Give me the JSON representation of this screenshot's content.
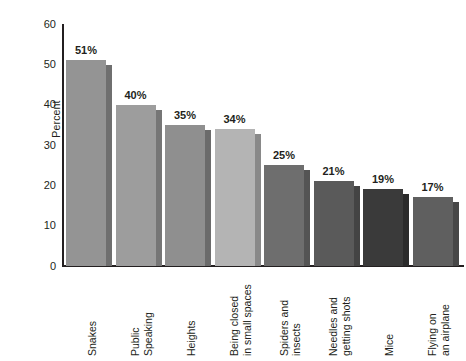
{
  "chart_data": {
    "type": "bar",
    "title": "",
    "subtitle": "",
    "xlabel": "",
    "ylabel": "Percent",
    "ylim": [
      0,
      60
    ],
    "ytick_step": 10,
    "yticks": [
      "60",
      "50",
      "40",
      "30",
      "20",
      "10",
      "0"
    ],
    "grid": false,
    "legend": null,
    "orientation": "vertical",
    "value_label_suffix": "%",
    "categories": [
      "Snakes",
      "Public Speaking",
      "Heights",
      "Being closed in small spaces",
      "Spiders and insects",
      "Needles and getting shots",
      "Mice",
      "Flying on an airplane"
    ],
    "category_label_lines": [
      [
        "Snakes"
      ],
      [
        "Public",
        "Speaking"
      ],
      [
        "Heights"
      ],
      [
        "Being closed",
        "in small spaces"
      ],
      [
        "Spiders and",
        "insects"
      ],
      [
        "Needles and",
        "getting shots"
      ],
      [
        "Mice"
      ],
      [
        "Flying on",
        "an airplane"
      ]
    ],
    "values": [
      51,
      40,
      35,
      34,
      25,
      21,
      19,
      17
    ],
    "value_labels": [
      "51%",
      "40%",
      "35%",
      "34%",
      "25%",
      "21%",
      "19%",
      "17%"
    ],
    "bar_colors": [
      "#949494",
      "#9d9d9d",
      "#8f8f8f",
      "#b4b4b4",
      "#6e6e6e",
      "#5a5a5a",
      "#3a3a3a",
      "#5f5f5f"
    ],
    "bar_shadow_colors": [
      "#6f6f6f",
      "#767676",
      "#6b6b6b",
      "#898989",
      "#545454",
      "#444444",
      "#2b2b2b",
      "#474747"
    ],
    "axis_color": "#231f20",
    "background_color": "#ffffff"
  }
}
